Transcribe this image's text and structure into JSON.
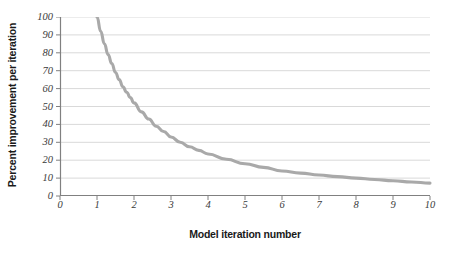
{
  "chart_data": {
    "type": "line",
    "title": "",
    "xlabel": "Model iteration number",
    "ylabel": "Percent improvement per iteration",
    "xlim": [
      0,
      10
    ],
    "ylim": [
      0,
      100
    ],
    "xticks": [
      "0",
      "1",
      "2",
      "3",
      "4",
      "5",
      "6",
      "7",
      "8",
      "9",
      "10"
    ],
    "yticks": [
      "0",
      "10",
      "20",
      "30",
      "40",
      "50",
      "60",
      "70",
      "80",
      "90",
      "100"
    ],
    "grid": "horizontal",
    "legend": "none",
    "series": [
      {
        "name": "Percent improvement per iteration",
        "color": "#a9a9a9",
        "x": [
          1.0,
          1.1,
          1.2,
          1.3,
          1.4,
          1.5,
          1.6,
          1.7,
          1.8,
          1.9,
          2.0,
          2.2,
          2.4,
          2.6,
          2.8,
          3.0,
          3.25,
          3.5,
          3.75,
          4.0,
          4.5,
          5.0,
          5.5,
          6.0,
          6.5,
          7.0,
          7.5,
          8.0,
          8.5,
          9.0,
          9.5,
          10.0
        ],
        "values": [
          100,
          92,
          85,
          79,
          74,
          69,
          65,
          61,
          58,
          55,
          52,
          47,
          43,
          39,
          36,
          33,
          30,
          27.5,
          25.5,
          23.5,
          20.5,
          18,
          16,
          14,
          12.8,
          11.7,
          10.8,
          10,
          9.2,
          8.5,
          7.8,
          7.2
        ]
      }
    ],
    "colors": {
      "curve": "#a9a9a9",
      "gridline": "#d9d9d9",
      "axis": "#808080",
      "tick_text": "#3a3a3a",
      "title_text": "#1a1a1a",
      "background": "#ffffff"
    }
  }
}
